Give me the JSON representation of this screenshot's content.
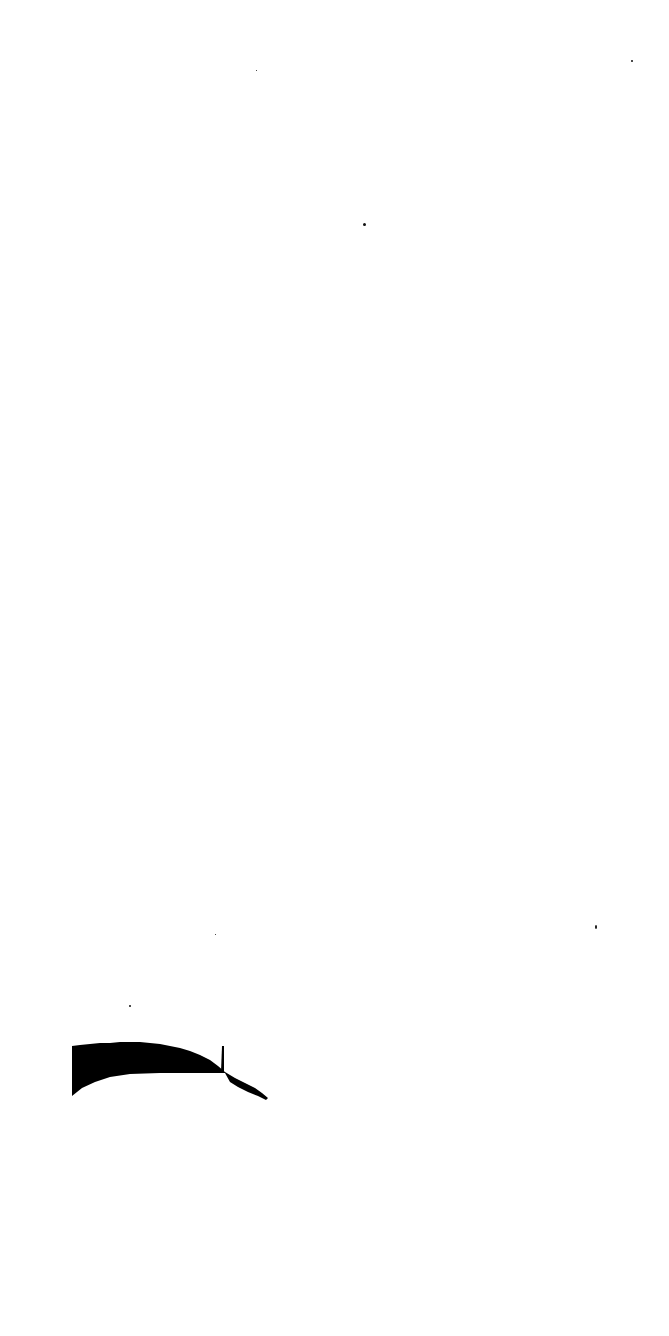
{
  "page": {
    "background": "#ffffff",
    "ink_color": "#000000",
    "legible_text": []
  },
  "figure_fragment": {
    "description": "black filled area shape with spike and tapering tail",
    "fill_color": "#000000"
  },
  "specks": [
    {
      "x": 256,
      "y": 70,
      "size": 1
    },
    {
      "x": 631,
      "y": 60,
      "size": 2
    },
    {
      "x": 364,
      "y": 224,
      "size": 2
    },
    {
      "x": 595,
      "y": 927,
      "size": 2
    },
    {
      "x": 215,
      "y": 934,
      "size": 1
    },
    {
      "x": 129,
      "y": 1005,
      "size": 2
    }
  ]
}
